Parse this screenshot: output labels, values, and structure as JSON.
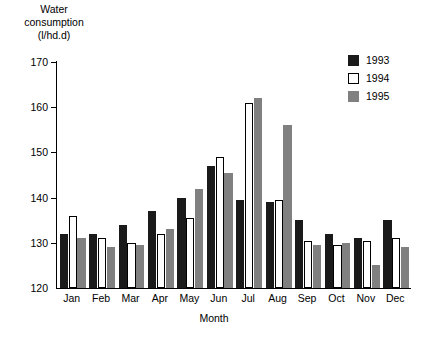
{
  "chart_data": {
    "type": "bar",
    "title": "Water consumption (l/hd.d)",
    "title_lines": [
      "Water",
      "consumption",
      "(l/hd.d)"
    ],
    "xlabel": "Month",
    "ylabel": "Water consumption (l/hd.d)",
    "ylim": [
      120,
      170
    ],
    "ytick_step": 10,
    "yticks": [
      120,
      130,
      140,
      150,
      160,
      170
    ],
    "ytick_labels": [
      "120",
      "130",
      "140",
      "150",
      "160",
      "170"
    ],
    "grid": false,
    "legend_position": "top-right",
    "categories": [
      "Jan",
      "Feb",
      "Mar",
      "Apr",
      "May",
      "Jun",
      "Jul",
      "Aug",
      "Sep",
      "Oct",
      "Nov",
      "Dec"
    ],
    "series": [
      {
        "name": "1993",
        "color": "#1a1a1a",
        "values": [
          132,
          132,
          134,
          137,
          140,
          147,
          139.5,
          139,
          135,
          132,
          131,
          135
        ]
      },
      {
        "name": "1994",
        "color": "#ffffff",
        "values": [
          136,
          131,
          130,
          132,
          135.5,
          149,
          161,
          139.5,
          130.5,
          129.5,
          130.5,
          131
        ]
      },
      {
        "name": "1995",
        "color": "#808080",
        "values": [
          131,
          129,
          129.5,
          133,
          142,
          145.5,
          162,
          156,
          129.5,
          130,
          125,
          129
        ]
      }
    ]
  },
  "legend": {
    "items": [
      {
        "label": "1993",
        "key": "y1993"
      },
      {
        "label": "1994",
        "key": "y1994"
      },
      {
        "label": "1995",
        "key": "y1995"
      }
    ]
  }
}
